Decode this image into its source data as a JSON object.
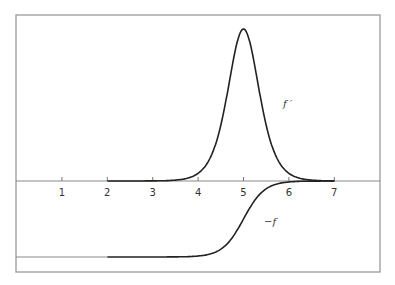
{
  "chart_data": {
    "type": "line",
    "title": "",
    "xlabel": "",
    "ylabel": "",
    "xlim": [
      0,
      8
    ],
    "x_ticks": [
      1,
      2,
      3,
      4,
      5,
      6,
      7
    ],
    "x_tick_labels": [
      "1",
      "2",
      "3",
      "4",
      "5",
      "6",
      "7"
    ],
    "grid": false,
    "legend": "none",
    "series": [
      {
        "name": "f′",
        "label": "f ′",
        "description": "bell-shaped peak (derivative of Fermi function) centered at x = 5",
        "x": [
          2,
          3,
          3.5,
          4,
          4.5,
          4.75,
          5,
          5.25,
          5.5,
          6,
          6.5,
          7
        ],
        "values": [
          0.0,
          0.02,
          0.06,
          0.2,
          0.62,
          1.15,
          2.0,
          1.15,
          0.62,
          0.2,
          0.03,
          0.0
        ]
      },
      {
        "name": "-f",
        "label": "−f",
        "description": "sigmoid step from −1 to 0 centered at x = 5",
        "x": [
          0,
          2,
          3,
          4,
          4.5,
          5,
          5.5,
          6,
          7
        ],
        "values": [
          -1,
          -1,
          -0.99,
          -0.95,
          -0.8,
          -0.5,
          -0.2,
          -0.05,
          0
        ]
      }
    ]
  },
  "labels": {
    "f_prime": "f ′",
    "minus_f": "−f"
  }
}
